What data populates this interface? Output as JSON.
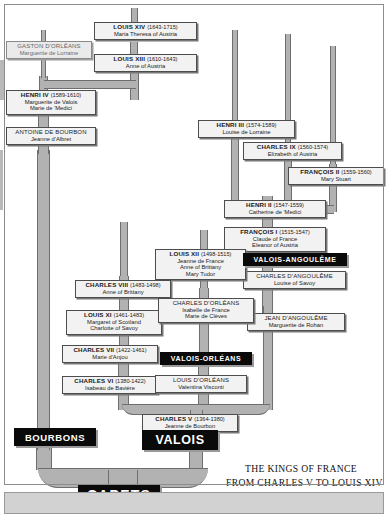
{
  "caption": {
    "line1": "THE KINGS OF FRANCE",
    "line2": "FROM CHARLES V TO LOUIS XIV"
  },
  "banners": [
    {
      "id": "valois-angouleme",
      "label": "VALOIS-ANGOULÊME"
    },
    {
      "id": "valois-orleans",
      "label": "VALOIS-ORLÉANS"
    },
    {
      "id": "bourbons",
      "label": "BOURBONS"
    },
    {
      "id": "valois",
      "label": "VALOIS"
    },
    {
      "id": "capets",
      "label": "CAPETS"
    }
  ],
  "people": [
    {
      "id": "gaston-dorleans",
      "name": "GASTON D'ORLÉANS",
      "years": "",
      "consorts": [
        "Marguerite de Lorraine"
      ]
    },
    {
      "id": "louis-xiv",
      "name": "LOUIS XIV",
      "years": "(1643-1715)",
      "consorts": [
        "Maria Theresa of Austria"
      ]
    },
    {
      "id": "louis-xiii",
      "name": "LOUIS XIII",
      "years": "(1610-1643)",
      "consorts": [
        "Anne of Austria"
      ]
    },
    {
      "id": "henri-iv",
      "name": "HENRI IV",
      "years": "(1589-1610)",
      "consorts": [
        "Marguerite de Valois",
        "Marie de 'Medici"
      ]
    },
    {
      "id": "antoine-de-bourbon",
      "name": "ANTOINE DE BOURBON",
      "years": "",
      "consorts": [
        "Jeanne d'Albret"
      ]
    },
    {
      "id": "henri-iii",
      "name": "HENRI III",
      "years": "(1574-1589)",
      "consorts": [
        "Louise de Lorraine"
      ]
    },
    {
      "id": "charles-ix",
      "name": "CHARLES IX",
      "years": "(1560-1574)",
      "consorts": [
        "Elizabeth of Austria"
      ]
    },
    {
      "id": "francois-ii",
      "name": "FRANÇOIS II",
      "years": "(1559-1560)",
      "consorts": [
        "Mary Stuart"
      ]
    },
    {
      "id": "henri-ii",
      "name": "HENRI II",
      "years": "(1547-1559)",
      "consorts": [
        "Catherine de 'Medici"
      ]
    },
    {
      "id": "francois-i",
      "name": "FRANÇOIS I",
      "years": "(1515-1547)",
      "consorts": [
        "Claude of France",
        "Eleanor of Austria"
      ]
    },
    {
      "id": "charles-dangouleme",
      "name": "CHARLES D'ANGOULÊME",
      "years": "",
      "consorts": [
        "Louise of Savoy"
      ]
    },
    {
      "id": "jean-dangouleme",
      "name": "JEAN D'ANGOULÊME",
      "years": "",
      "consorts": [
        "Marguerite de Rohan"
      ]
    },
    {
      "id": "louis-xii",
      "name": "LOUIS XII",
      "years": "(1498-1515)",
      "consorts": [
        "Jeanne de France",
        "Anne of Brittany",
        "Mary Tudor"
      ]
    },
    {
      "id": "charles-viii",
      "name": "CHARLES VIII",
      "years": "(1483-1498)",
      "consorts": [
        "Anne of Brittany"
      ]
    },
    {
      "id": "louis-xi",
      "name": "LOUIS XI",
      "years": "(1461-1483)",
      "consorts": [
        "Margaret of Scotland",
        "Charlotte of Savoy"
      ]
    },
    {
      "id": "charles-dorleans",
      "name": "CHARLES D'ORLÉANS",
      "years": "",
      "consorts": [
        "Isabelle de France",
        "Marie de Clèves"
      ]
    },
    {
      "id": "charles-vii",
      "name": "CHARLES VII",
      "years": "(1422-1461)",
      "consorts": [
        "Marie d'Anjou"
      ]
    },
    {
      "id": "charles-vi",
      "name": "CHARLES VI",
      "years": "(1380-1422)",
      "consorts": [
        "Isabeau de Bavière"
      ]
    },
    {
      "id": "louis-dorleans",
      "name": "LOUIS D'ORLÉANS",
      "years": "",
      "consorts": [
        "Valentina Visconti"
      ]
    },
    {
      "id": "charles-v",
      "name": "CHARLES V",
      "years": "(1364-1380)",
      "consorts": [
        "Jeanne de Bourbon"
      ]
    }
  ],
  "colors": {
    "banner_bg": "#0a0a0a",
    "banner_text": "#ffffff",
    "plaque_bg": "#f2f2f2",
    "plaque_border": "#4d4d4d",
    "branch": "#b2b2b2",
    "page_bg": "#ffffff",
    "footer_bg": "#d2d2d2"
  }
}
